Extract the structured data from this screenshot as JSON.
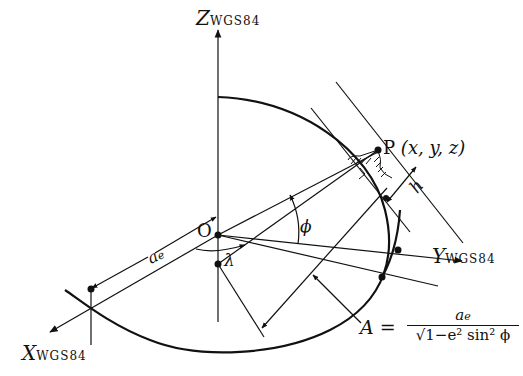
{
  "diagram": {
    "type": "geodetic-coordinate-system",
    "axes": {
      "z": {
        "letter": "Z",
        "subscript": "WGS84"
      },
      "y": {
        "letter": "Y",
        "subscript": "WGS84"
      },
      "x": {
        "letter": "X",
        "subscript": "WGS84"
      }
    },
    "origin": {
      "label": "O"
    },
    "point": {
      "label": "P",
      "coords": "(x, y, z)"
    },
    "height": {
      "label": "h"
    },
    "latitude": {
      "label": "ϕ"
    },
    "longitude": {
      "label": "λ"
    },
    "semi_major": {
      "label": "a",
      "subscript": "e"
    },
    "radius_formula": {
      "lhs": "A",
      "eq": "=",
      "numerator": "a",
      "numerator_sub": "e",
      "sqrt": "√",
      "denominator": "1−e² sin² ϕ"
    },
    "colors": {
      "line": "#111111",
      "background": "#ffffff"
    }
  }
}
